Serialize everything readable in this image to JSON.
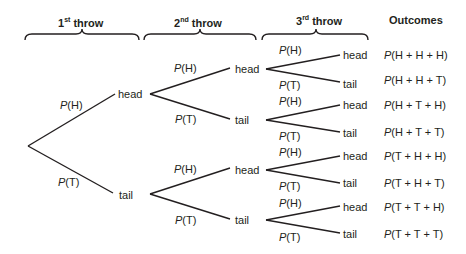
{
  "headers": {
    "throw1": {
      "num": "1",
      "sup": "st",
      "word": " throw"
    },
    "throw2": {
      "num": "2",
      "sup": "nd",
      "word": " throw"
    },
    "throw3": {
      "num": "3",
      "sup": "rd",
      "word": " throw"
    },
    "outcomes": "Outcomes"
  },
  "level1": {
    "head": "head",
    "tail": "tail",
    "p_head": {
      "p": "P",
      "arg": "(H)"
    },
    "p_tail": {
      "p": "P",
      "arg": "(T)"
    }
  },
  "level2": [
    {
      "head": "head",
      "tail": "tail",
      "p_head": {
        "p": "P",
        "arg": "(H)"
      },
      "p_tail": {
        "p": "P",
        "arg": "(T)"
      }
    },
    {
      "head": "head",
      "tail": "tail",
      "p_head": {
        "p": "P",
        "arg": "(H)"
      },
      "p_tail": {
        "p": "P",
        "arg": "(T)"
      }
    }
  ],
  "level3": [
    {
      "head": "head",
      "tail": "tail",
      "p_head": {
        "p": "P",
        "arg": "(H)"
      },
      "p_tail": {
        "p": "P",
        "arg": "(T)"
      }
    },
    {
      "head": "head",
      "tail": "tail",
      "p_head": {
        "p": "P",
        "arg": "(H)"
      },
      "p_tail": {
        "p": "P",
        "arg": "(T)"
      }
    },
    {
      "head": "head",
      "tail": "tail",
      "p_head": {
        "p": "P",
        "arg": "(H)"
      },
      "p_tail": {
        "p": "P",
        "arg": "(T)"
      }
    },
    {
      "head": "head",
      "tail": "tail",
      "p_head": {
        "p": "P",
        "arg": "(H)"
      },
      "p_tail": {
        "p": "P",
        "arg": "(T)"
      }
    }
  ],
  "outcomes": [
    {
      "p": "P",
      "arg": "(H + H + H)"
    },
    {
      "p": "P",
      "arg": "(H + H + T)"
    },
    {
      "p": "P",
      "arg": "(H + T + H)"
    },
    {
      "p": "P",
      "arg": "(H + T + T)"
    },
    {
      "p": "P",
      "arg": "(T + H + H)"
    },
    {
      "p": "P",
      "arg": "(T + H + T)"
    },
    {
      "p": "P",
      "arg": "(T + T + H)"
    },
    {
      "p": "P",
      "arg": "(T + T + T)"
    }
  ]
}
